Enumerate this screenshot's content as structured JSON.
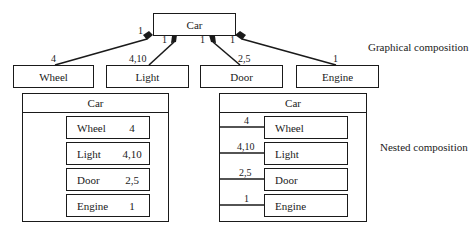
{
  "graphical": {
    "caption": "Graphical composition",
    "whole": "Car",
    "parts": [
      {
        "name": "Wheel",
        "whole_mult": "1",
        "part_mult": "4"
      },
      {
        "name": "Light",
        "whole_mult": "1",
        "part_mult": "4,10"
      },
      {
        "name": "Door",
        "whole_mult": "1",
        "part_mult": "2,5"
      },
      {
        "name": "Engine",
        "whole_mult": "1",
        "part_mult": "1"
      }
    ]
  },
  "nested_left": {
    "whole": "Car",
    "parts": [
      {
        "name": "Wheel",
        "mult": "4"
      },
      {
        "name": "Light",
        "mult": "4,10"
      },
      {
        "name": "Door",
        "mult": "2,5"
      },
      {
        "name": "Engine",
        "mult": "1"
      }
    ]
  },
  "nested_right": {
    "caption": "Nested composition",
    "whole": "Car",
    "parts": [
      {
        "name": "Wheel",
        "mult": "4"
      },
      {
        "name": "Light",
        "mult": "4,10"
      },
      {
        "name": "Door",
        "mult": "2,5"
      },
      {
        "name": "Engine",
        "mult": "1"
      }
    ]
  },
  "colors": {
    "stroke": "#1a1a1a",
    "background": "#ffffff"
  }
}
